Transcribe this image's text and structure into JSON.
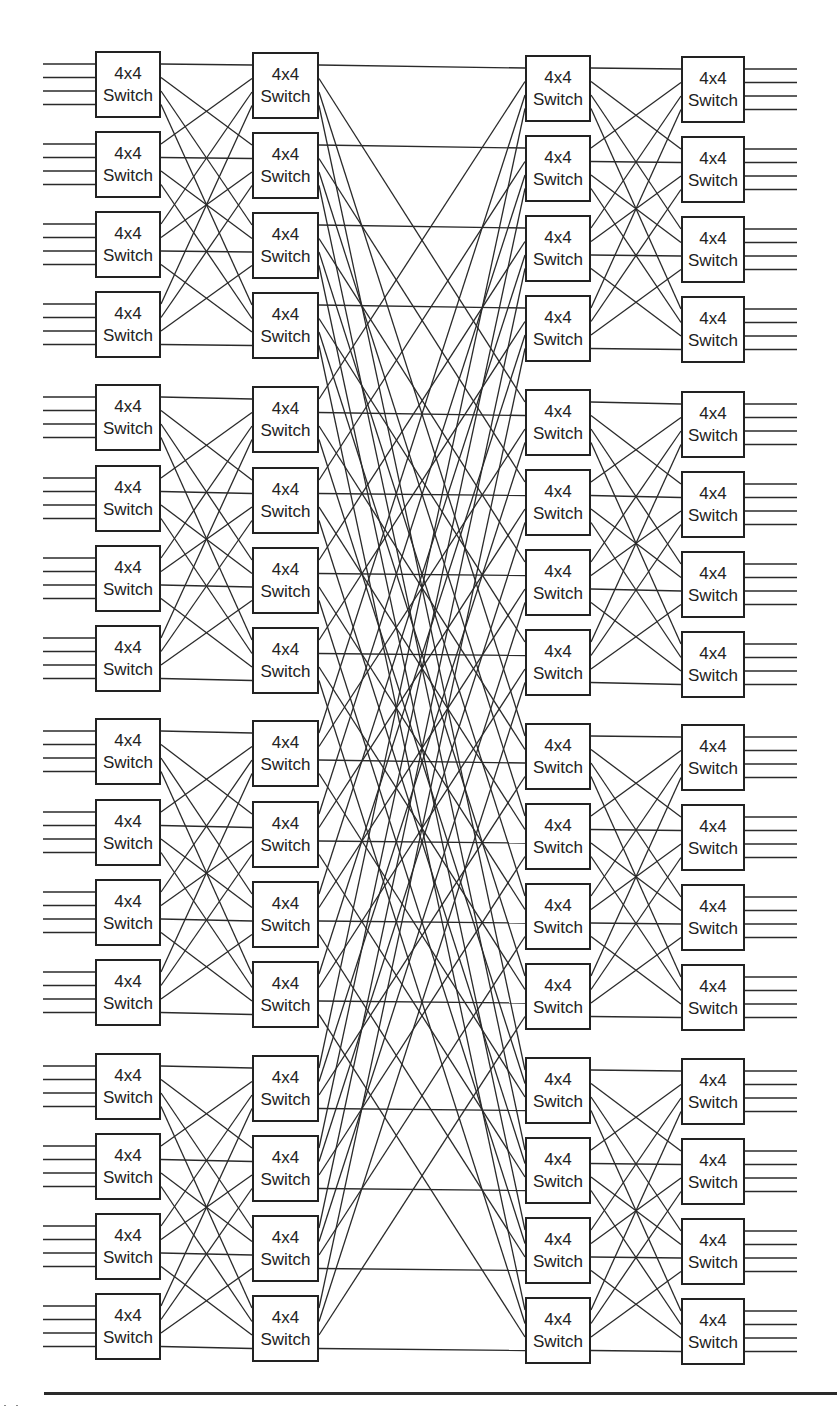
{
  "diagram": {
    "switch_label_line1": "4x4",
    "switch_label_line2": "Switch",
    "colors": {
      "line": "#2a2a2a",
      "box_border": "#222222",
      "background": "#ffffff"
    },
    "columns": [
      {
        "name": "stage-1-input",
        "x": 95,
        "width": 66,
        "box_tops": [
          51,
          131,
          211,
          291,
          384,
          465,
          545,
          625,
          718,
          799,
          879,
          959,
          1053,
          1133,
          1213,
          1293
        ]
      },
      {
        "name": "stage-2",
        "x": 252,
        "width": 67,
        "box_tops": [
          52,
          132,
          212,
          292,
          386,
          467,
          547,
          627,
          720,
          801,
          881,
          961,
          1055,
          1135,
          1215,
          1295
        ]
      },
      {
        "name": "stage-3",
        "x": 525,
        "width": 66,
        "box_tops": [
          55,
          135,
          215,
          295,
          389,
          469,
          549,
          629,
          723,
          803,
          883,
          963,
          1057,
          1137,
          1217,
          1297
        ]
      },
      {
        "name": "stage-4-output",
        "x": 681,
        "width": 64,
        "box_tops": [
          56,
          136,
          216,
          296,
          391,
          471,
          551,
          631,
          724,
          804,
          884,
          964,
          1058,
          1138,
          1218,
          1298
        ]
      }
    ],
    "box_height": 67,
    "port_offsets": [
      13,
      26.5,
      40,
      53.5
    ],
    "input_line_start_x": 43,
    "output_line_end_x": 797,
    "groups": 4,
    "boxes_per_group": 4,
    "ports_per_box": 4,
    "bottom_rule": {
      "x1": 44,
      "x2": 837,
      "y": 1393
    }
  }
}
